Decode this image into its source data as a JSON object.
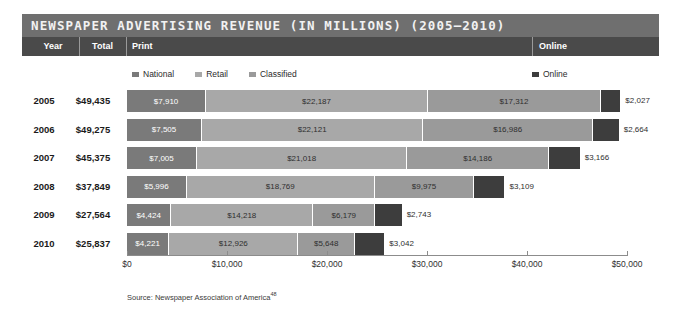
{
  "title": "NEWSPAPER ADVERTISING REVENUE (IN MILLIONS) (2005–2010)",
  "columns": {
    "year": "Year",
    "total": "Total",
    "print": "Print",
    "online": "Online"
  },
  "legend": {
    "print_items": [
      {
        "label": "National",
        "color": "#7a7a7a"
      },
      {
        "label": "Retail",
        "color": "#a8a8a8"
      },
      {
        "label": "Classified",
        "color": "#9a9a9a"
      }
    ],
    "online_item": {
      "label": "Online",
      "color": "#3d3d3d"
    }
  },
  "source": "Source: Newspaper Association of America",
  "source_ref": "48",
  "colors": {
    "title_bar": "#6f6f6f",
    "header_bar": "#4a4a4a",
    "national": "#7a7a7a",
    "retail": "#a8a8a8",
    "classified": "#9a9a9a",
    "online": "#3d3d3d",
    "axis": "#8c8c8c"
  },
  "chart_data": {
    "type": "bar",
    "orientation": "horizontal",
    "stacked": true,
    "title": "NEWSPAPER ADVERTISING REVENUE (IN MILLIONS) (2005–2010)",
    "xlabel": "",
    "ylabel": "",
    "xlim": [
      0,
      50000
    ],
    "xticks": [
      0,
      10000,
      20000,
      30000,
      40000,
      50000
    ],
    "xtick_labels": [
      "$0",
      "$10,000",
      "$20,000",
      "$30,000",
      "$40,000",
      "$50,000"
    ],
    "grid": false,
    "legend_position": "top",
    "categories": [
      "2005",
      "2006",
      "2007",
      "2008",
      "2009",
      "2010"
    ],
    "series": [
      {
        "name": "National",
        "values": [
          7910,
          7505,
          7005,
          5996,
          4424,
          4221
        ]
      },
      {
        "name": "Retail",
        "values": [
          22187,
          22121,
          21018,
          18769,
          14218,
          12926
        ]
      },
      {
        "name": "Classified",
        "values": [
          17312,
          16986,
          14186,
          9975,
          6179,
          5648
        ]
      },
      {
        "name": "Online",
        "values": [
          2027,
          2664,
          3166,
          3109,
          2743,
          3042
        ]
      }
    ],
    "totals": [
      49435,
      49275,
      45375,
      37849,
      27564,
      25837
    ],
    "rows": [
      {
        "year": "2005",
        "total": "$49,435",
        "national": "$7,910",
        "retail": "$22,187",
        "classified": "$17,312",
        "online": "$2,027"
      },
      {
        "year": "2006",
        "total": "$49,275",
        "national": "$7,505",
        "retail": "$22,121",
        "classified": "$16,986",
        "online": "$2,664"
      },
      {
        "year": "2007",
        "total": "$45,375",
        "national": "$7,005",
        "retail": "$21,018",
        "classified": "$14,186",
        "online": "$3,166"
      },
      {
        "year": "2008",
        "total": "$37,849",
        "national": "$5,996",
        "retail": "$18,769",
        "classified": "$9,975",
        "online": "$3,109"
      },
      {
        "year": "2009",
        "total": "$27,564",
        "national": "$4,424",
        "retail": "$14,218",
        "classified": "$6,179",
        "online": "$2,743"
      },
      {
        "year": "2010",
        "total": "$25,837",
        "national": "$4,221",
        "retail": "$12,926",
        "classified": "$5,648",
        "online": "$3,042"
      }
    ]
  }
}
